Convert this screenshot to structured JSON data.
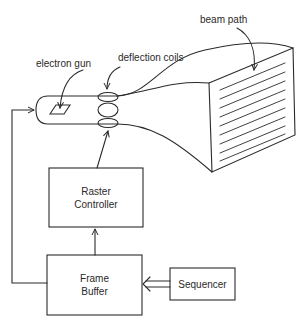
{
  "diagram": {
    "labels": {
      "electron_gun": "electron gun",
      "deflection_coils": "deflection coils",
      "beam_path": "beam path"
    },
    "blocks": {
      "raster_controller": {
        "line1": "Raster",
        "line2": "Controller"
      },
      "frame_buffer": {
        "line1": "Frame",
        "line2": "Buffer"
      },
      "sequencer": {
        "label": "Sequencer"
      }
    },
    "connections": [
      {
        "from": "Sequencer",
        "to": "Frame Buffer",
        "style": "double-line arrow"
      },
      {
        "from": "Frame Buffer",
        "to": "Raster Controller",
        "style": "arrow"
      },
      {
        "from": "Raster Controller",
        "to": "deflection coils",
        "style": "arrow"
      },
      {
        "from": "Frame Buffer",
        "to": "electron gun",
        "style": "arrow"
      }
    ],
    "scan_lines": 10,
    "colors": {
      "stroke": "#2a2a2a",
      "background": "#ffffff"
    }
  }
}
